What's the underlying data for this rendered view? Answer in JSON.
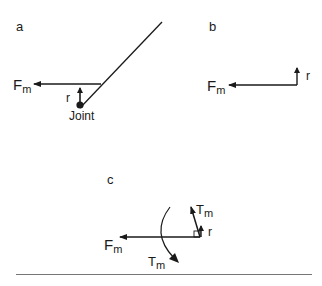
{
  "panels": {
    "a": {
      "label": "a",
      "force": "F",
      "force_sub": "m",
      "radius": "r",
      "joint": "Joint"
    },
    "b": {
      "label": "b",
      "force": "F",
      "force_sub": "m",
      "radius": "r"
    },
    "c": {
      "label": "c",
      "force": "F",
      "force_sub": "m",
      "radius": "r",
      "torque_vec": "T",
      "torque_vec_sub": "m",
      "torque_rot": "T",
      "torque_rot_sub": "m"
    }
  },
  "colors": {
    "ink": "#1a1a1a",
    "rule": "#777777"
  }
}
